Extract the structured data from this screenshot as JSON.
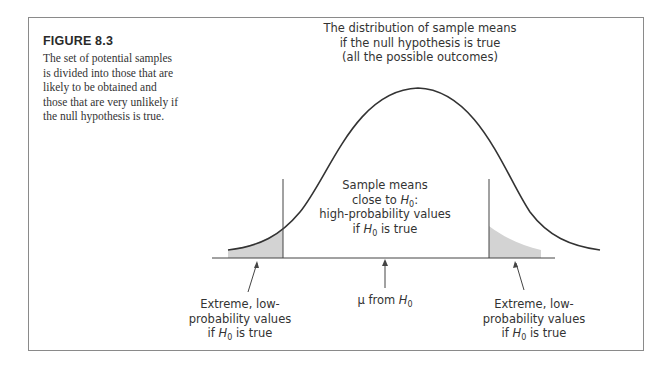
{
  "figure": {
    "label": "FIGURE 8.3",
    "caption_lines": [
      "The set of potential samples",
      "is divided into those that are",
      "likely to be obtained and",
      "those that are very unlikely if",
      "the null hypothesis is true."
    ]
  },
  "diagram": {
    "title_lines": [
      "The distribution of sample means",
      "if the null hypothesis is true",
      "(all the possible outcomes)"
    ],
    "center_label": {
      "line1": "Sample means",
      "line2_prefix": "close to ",
      "line2_symbol": "H",
      "line2_sub": "0",
      "line2_suffix": ":",
      "line3": "high-probability values",
      "line4_prefix": "if ",
      "line4_symbol": "H",
      "line4_sub": "0",
      "line4_suffix": " is true"
    },
    "mean_label": {
      "prefix": "μ from ",
      "symbol": "H",
      "sub": "0"
    },
    "left_tail_label": {
      "line1": "Extreme, low-",
      "line2": "probability values",
      "line3_prefix": "if ",
      "line3_symbol": "H",
      "line3_sub": "0",
      "line3_suffix": " is true"
    },
    "right_tail_label": {
      "line1": "Extreme, low-",
      "line2": "probability values",
      "line3_prefix": "if ",
      "line3_symbol": "H",
      "line3_sub": "0",
      "line3_suffix": " is true"
    },
    "colors": {
      "curve": "#333333",
      "tail_fill": "#d3d3d3",
      "text": "#333333",
      "frame": "#8a8a8a"
    }
  }
}
